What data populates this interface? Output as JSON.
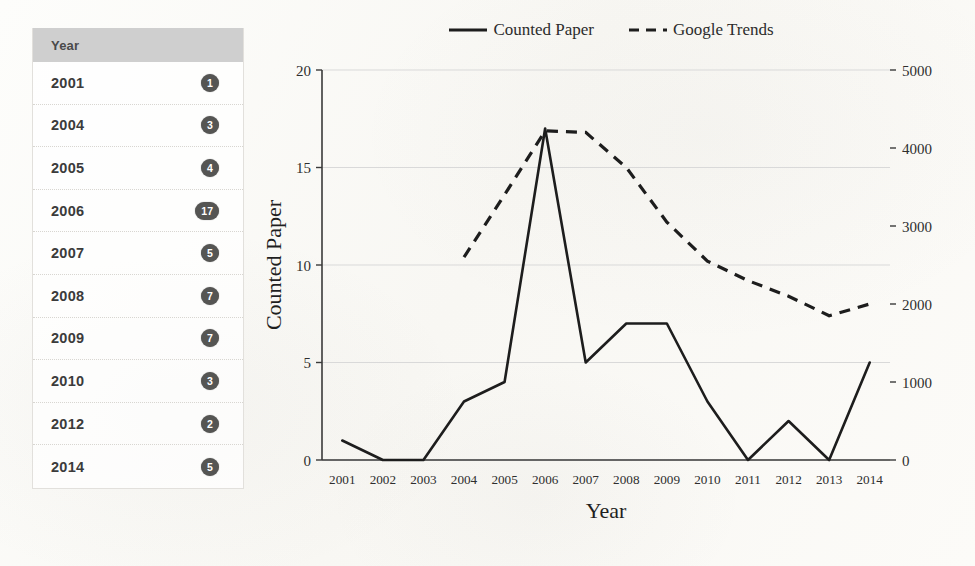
{
  "table": {
    "header": "Year",
    "rows": [
      {
        "year": "2001",
        "count": "1"
      },
      {
        "year": "2004",
        "count": "3"
      },
      {
        "year": "2005",
        "count": "4"
      },
      {
        "year": "2006",
        "count": "17"
      },
      {
        "year": "2007",
        "count": "5"
      },
      {
        "year": "2008",
        "count": "7"
      },
      {
        "year": "2009",
        "count": "7"
      },
      {
        "year": "2010",
        "count": "3"
      },
      {
        "year": "2012",
        "count": "2"
      },
      {
        "year": "2014",
        "count": "5"
      }
    ]
  },
  "colors": {
    "table_header_bg": "#cfcfcf",
    "badge_bg": "#555553",
    "badge_text": "#ffffff",
    "series_line": "#1d1d1d",
    "gridline": "#d9d9d9",
    "page_bg": "#fbfaf8"
  },
  "chart_data": {
    "type": "line",
    "title": "",
    "xlabel": "Year",
    "ylabel": "Counted Paper",
    "y2label": "",
    "categories": [
      "2001",
      "2002",
      "2003",
      "2004",
      "2005",
      "2006",
      "2007",
      "2008",
      "2009",
      "2010",
      "2011",
      "2012",
      "2013",
      "2014"
    ],
    "ylim": [
      0,
      20
    ],
    "yticks": [
      0,
      5,
      10,
      15,
      20
    ],
    "ytick_labels": [
      "0",
      "5",
      "10",
      "15",
      "20"
    ],
    "y2lim": [
      0,
      5000
    ],
    "y2ticks": [
      0,
      1000,
      2000,
      3000,
      4000,
      5000
    ],
    "y2tick_labels": [
      "0",
      "1000",
      "2000",
      "3000",
      "4000",
      "5000"
    ],
    "grid": true,
    "legend_position": "top-center",
    "series": [
      {
        "name": "Counted Paper",
        "axis": "left",
        "style": "solid",
        "values": [
          1,
          0,
          0,
          3,
          4,
          17,
          5,
          7,
          7,
          3,
          0,
          2,
          0,
          5
        ]
      },
      {
        "name": "Google Trends",
        "axis": "right",
        "style": "dashed",
        "values": [
          null,
          null,
          null,
          2600,
          3400,
          4220,
          4200,
          3750,
          3050,
          2550,
          2300,
          2100,
          1850,
          2000
        ]
      }
    ]
  }
}
